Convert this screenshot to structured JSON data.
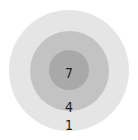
{
  "diagram": {
    "type": "concentric-circles",
    "rings": [
      {
        "level": "outer",
        "label": "1",
        "color": "#e5e5e5"
      },
      {
        "level": "middle",
        "label": "4",
        "color": "#c3c3c3"
      },
      {
        "level": "inner",
        "label": "7",
        "color": "#a9a9a9"
      }
    ],
    "text_color": "#1c1c1c"
  }
}
